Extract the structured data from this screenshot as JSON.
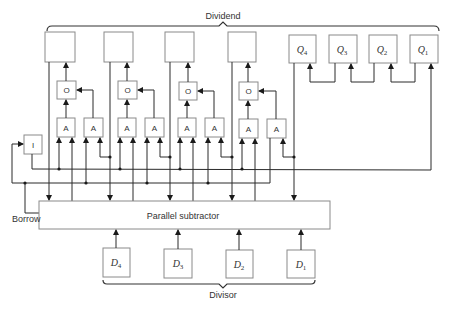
{
  "labels": {
    "dividend": "Dividend",
    "divisor": "Divisor",
    "borrow": "Borrow",
    "subtractor": "Parallel subtractor",
    "inverter": "I",
    "or_gate": "O",
    "and_gate": "A"
  },
  "registers": {
    "quotient": [
      {
        "letter": "Q",
        "sub": "4"
      },
      {
        "letter": "Q",
        "sub": "3"
      },
      {
        "letter": "Q",
        "sub": "2"
      },
      {
        "letter": "Q",
        "sub": "1"
      }
    ],
    "divisor": [
      {
        "letter": "D",
        "sub": "4"
      },
      {
        "letter": "D",
        "sub": "3"
      },
      {
        "letter": "D",
        "sub": "2"
      },
      {
        "letter": "D",
        "sub": "1"
      }
    ],
    "remainder_count": 4
  },
  "colors": {
    "line": "#2a2a2a",
    "box_border": "#8a8a8a",
    "text": "#333333",
    "background": "#ffffff"
  }
}
